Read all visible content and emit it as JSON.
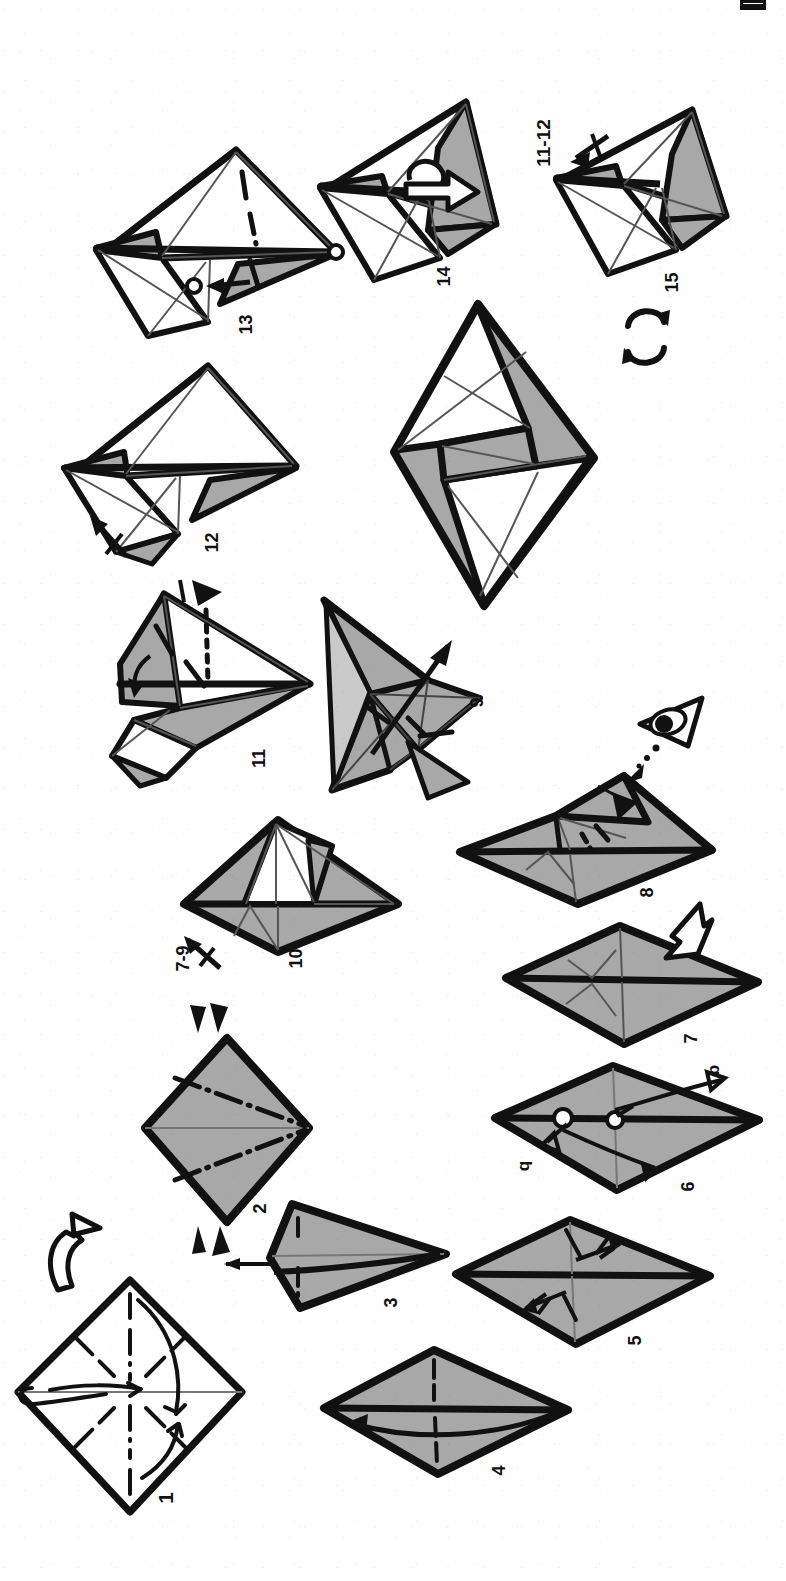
{
  "document": {
    "kind": "origami-folding-diagram",
    "orientation": "rotated-90-ccw",
    "page_background": "#fefefe",
    "paper_front_color": "#a8a8a8",
    "paper_back_color": "#ffffff",
    "line_color": "#111111"
  },
  "steps": [
    {
      "id": "s1",
      "number": "1",
      "caption": "1",
      "shape": "square-on-point",
      "fill": "back",
      "notes": "pre-crease diagonals and verticals; curved valley arrows to centre; pleat/turn symbol at left"
    },
    {
      "id": "s2",
      "number": "2",
      "caption": "2",
      "shape": "diamond",
      "fill": "front",
      "notes": "dash-dot mountain lines converging to right vertex; paired solid arrowheads top and bottom"
    },
    {
      "id": "s3",
      "number": "3",
      "caption": "3",
      "shape": "kite",
      "fill": "front",
      "notes": "flattened kite, straight arrow pointing left"
    },
    {
      "id": "s4",
      "number": "4",
      "caption": "4",
      "shape": "rhombus-wide",
      "fill": "front",
      "notes": "heavy horizontal centre edge; long curved arrow to the left"
    },
    {
      "id": "s5",
      "number": "5",
      "caption": "5",
      "shape": "rhombus-wide",
      "fill": "front",
      "notes": "two double-headed squash arrows above and below the centre line"
    },
    {
      "id": "s6",
      "number": "6",
      "caption": "6",
      "shape": "rhombus-wide",
      "fill": "front",
      "notes": "two small open circles on centre line; curved rotate arrows with hook marks"
    },
    {
      "id": "s7",
      "number": "7",
      "caption": "7",
      "shape": "rhombus-wide",
      "fill": "front",
      "notes": "internal crease V's; large hollow outline arrow pointing up-right"
    },
    {
      "id": "s8",
      "number": "8",
      "caption": "8",
      "shape": "rhombus-folded",
      "fill": "front",
      "notes": "flap folded at top right, dotted hidden crease, solid black arrowhead"
    },
    {
      "id": "s9",
      "number": "9",
      "caption": "9",
      "shape": "three-d",
      "fill": "front",
      "notes": "three-dimensional intermediate form; thin straight arrow pointing up-right"
    },
    {
      "id": "s10",
      "number": "10",
      "caption": "10",
      "shape": "rhombus-open",
      "fill": "mixed",
      "notes": "white inner flap raised; repeat arrow labelled 7-9"
    },
    {
      "id": "s11",
      "number": "11",
      "caption": "11",
      "shape": "three-d",
      "fill": "mixed",
      "notes": "dotted hidden edge, small curved arrow, solid black arrowhead at top"
    },
    {
      "id": "s12",
      "number": "12",
      "caption": "12",
      "shape": "three-d",
      "fill": "mixed",
      "notes": "repeat arrow at lower left"
    },
    {
      "id": "s13",
      "number": "13",
      "caption": "13",
      "shape": "three-d",
      "fill": "mixed",
      "notes": "two small open circles marking reference points; short straight arrow between them"
    },
    {
      "id": "s14",
      "number": "14",
      "caption": "14",
      "shape": "three-d",
      "fill": "mixed",
      "notes": "hollow looping rotate/roll arrow"
    },
    {
      "id": "s15",
      "number": "15",
      "caption": "15",
      "shape": "three-d",
      "fill": "mixed",
      "notes": "repeat arrow labelled 11-12; turn-over symbol below"
    },
    {
      "id": "sFinal",
      "number": "",
      "caption": "",
      "shape": "pinwheel-diamond",
      "fill": "mixed",
      "notes": "final unnumbered completed model"
    }
  ],
  "labels": {
    "repeat_7_9": "7-9",
    "repeat_11_12": "11-12",
    "step6_arrow_a": "b",
    "step6_arrow_b": "q"
  },
  "symbols": [
    {
      "id": "sym-turn-over-1",
      "name": "turn-over-arrow",
      "near_step": "1",
      "note": "large hollow arrow, flip the paper over"
    },
    {
      "id": "sym-arrowheads-2",
      "name": "solid-arrowhead-pair",
      "near_step": "2",
      "note": "two pairs of filled triangles, top and bottom"
    },
    {
      "id": "sym-eye-8",
      "name": "eye-icon",
      "near_step": "8",
      "note": "viewing-direction eye with dotted sight line"
    },
    {
      "id": "sym-hollow-7",
      "name": "hollow-push-arrow",
      "near_step": "7",
      "note": "open outline arrow, open out / inflate"
    },
    {
      "id": "sym-roll-14",
      "name": "roll-over-arrow",
      "near_step": "14",
      "note": "hollow looping arrow"
    },
    {
      "id": "sym-turnover-15",
      "name": "turn-over-symbol",
      "near_step": "15",
      "note": "two curved arrows forming a circle"
    },
    {
      "id": "sym-repeat-10",
      "name": "repeat-arrow",
      "near_step": "10",
      "note": "arrow with a single cross-hatch, repeat steps 7-9"
    },
    {
      "id": "sym-repeat-12",
      "name": "repeat-arrow",
      "near_step": "12",
      "note": "arrow with a single cross-hatch"
    },
    {
      "id": "sym-repeat-15",
      "name": "repeat-arrow",
      "near_step": "15",
      "note": "arrow with a single cross-hatch, repeat steps 11-12"
    }
  ],
  "edge_marker": {
    "name": "page-edge-mark",
    "note": "small black scan mark at top edge"
  }
}
